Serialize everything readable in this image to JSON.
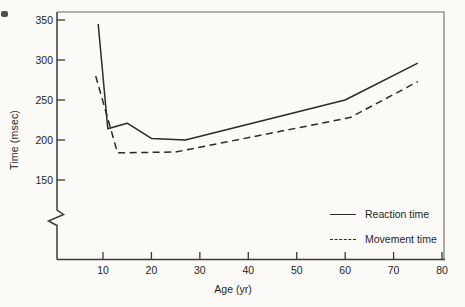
{
  "chart_data": {
    "type": "line",
    "title": "",
    "xlabel": "Age (yr)",
    "ylabel": "Time (msec)",
    "x_ticks": [
      10,
      20,
      30,
      40,
      50,
      60,
      70,
      80
    ],
    "y_ticks": [
      150,
      200,
      250,
      300,
      350
    ],
    "xlim": [
      0,
      80
    ],
    "ylim": [
      150,
      350
    ],
    "y_axis_break": true,
    "grid": false,
    "legend_position": "inside-bottom-right",
    "series": [
      {
        "name": "Reaction time",
        "style": "solid",
        "points": [
          [
            9,
            345
          ],
          [
            11,
            214
          ],
          [
            15,
            221
          ],
          [
            20,
            202
          ],
          [
            27,
            200
          ],
          [
            60,
            250
          ],
          [
            75,
            296
          ]
        ]
      },
      {
        "name": "Movement time",
        "style": "dashed",
        "points": [
          [
            8.5,
            280
          ],
          [
            13,
            184
          ],
          [
            25,
            185
          ],
          [
            61,
            228
          ],
          [
            75,
            273
          ]
        ]
      }
    ],
    "colors": {
      "line": "#2a2a2a",
      "axis": "#3a3a3a",
      "frame": "#9a9a9a",
      "background": "#fbfaf7",
      "text": "#1f1f1f"
    }
  }
}
